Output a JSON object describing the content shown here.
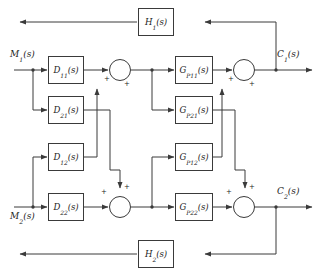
{
  "diagram": {
    "type": "block-diagram",
    "stroke_color": "#3a3a3a",
    "text_color": "#1c1c1c",
    "background": "#ffffff"
  },
  "signals": {
    "input_1": "M",
    "input_1_sub": "1",
    "input_1_arg": "(s)",
    "input_2": "M",
    "input_2_sub": "2",
    "input_2_arg": "(s)",
    "output_1": "C",
    "output_1_sub": "1",
    "output_1_arg": "(s)",
    "output_2": "C",
    "output_2_sub": "2",
    "output_2_arg": "(s)"
  },
  "controller_blocks": [
    {
      "name": "D",
      "sub": "11",
      "arg": "(s)",
      "label": "D11(s)"
    },
    {
      "name": "D",
      "sub": "21",
      "arg": "(s)",
      "label": "D21(s)"
    },
    {
      "name": "D",
      "sub": "12",
      "arg": "(s)",
      "label": "D12(s)"
    },
    {
      "name": "D",
      "sub": "22",
      "arg": "(s)",
      "label": "D22(s)"
    }
  ],
  "plant_blocks": [
    {
      "name": "G",
      "sub": "P11",
      "arg": "(s)",
      "label": "GP11(s)"
    },
    {
      "name": "G",
      "sub": "P21",
      "arg": "(s)",
      "label": "GP21(s)"
    },
    {
      "name": "G",
      "sub": "P12",
      "arg": "(s)",
      "label": "GP12(s)"
    },
    {
      "name": "G",
      "sub": "P22",
      "arg": "(s)",
      "label": "GP22(s)"
    }
  ],
  "feedback_blocks": [
    {
      "name": "H",
      "sub": "1",
      "arg": "(s)",
      "label": "H1(s)"
    },
    {
      "name": "H",
      "sub": "2",
      "arg": "(s)",
      "label": "H2(s)"
    }
  ],
  "summing_junctions": [
    {
      "id": "sum-1",
      "left_sign": "+",
      "second_sign": "+",
      "second_port": "bottom"
    },
    {
      "id": "sum-2",
      "left_sign": "+",
      "second_sign": "+",
      "second_port": "bottom"
    },
    {
      "id": "sum-3",
      "left_sign": "+",
      "second_sign": "+",
      "second_port": "top"
    },
    {
      "id": "sum-4",
      "left_sign": "+",
      "second_sign": "+",
      "second_port": "top"
    }
  ]
}
